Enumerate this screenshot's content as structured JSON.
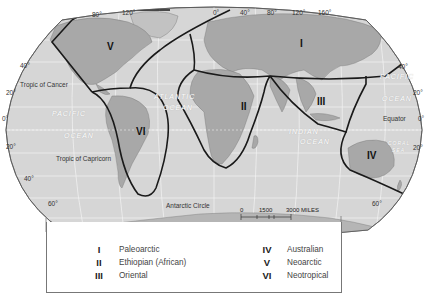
{
  "map": {
    "title": "Zoogeographic Realms",
    "projection_label": "ROBINSON PROJECTION",
    "longitude_labels": [
      "80°",
      "120°",
      "0°",
      "40°",
      "80°",
      "120°",
      "160°"
    ],
    "latitude_labels": {
      "left": [
        "40°",
        "20°",
        "0°",
        "20°",
        "40°",
        "60°"
      ],
      "right": [
        "40°",
        "20°",
        "0°",
        "20°",
        "60°"
      ]
    },
    "lines": {
      "tropic_of_cancer": "Tropic of Cancer",
      "tropic_of_capricorn": "Tropic of Capricorn",
      "equator": "Equator",
      "antarctic_circle": "Antarctic Circle"
    },
    "oceans": {
      "pacific_west_1": "PACIFIC",
      "pacific_west_2": "OCEAN",
      "atlantic_1": "ATLANTIC",
      "atlantic_2": "OCEAN",
      "indian_1": "INDIAN",
      "indian_2": "OCEAN",
      "pacific_east_1": "PACIFIC",
      "pacific_east_2": "OCEAN",
      "coral_1": "CORAL",
      "coral_2": "SEA"
    },
    "realm_markers": [
      "I",
      "II",
      "III",
      "IV",
      "V",
      "VI"
    ],
    "scale": {
      "miles_label": "0     1500     3000 MILES",
      "miles": [
        "0",
        "1500",
        "3000 MILES"
      ],
      "km": [
        "0",
        "1500",
        "3000 KILOMETRES"
      ]
    },
    "colors": {
      "ocean": "#d4d4d4",
      "land": "#a9a9a9",
      "boundary": "#1a1a1a",
      "grid": "#f2f2f2"
    }
  },
  "legend": {
    "items": [
      {
        "numeral": "I",
        "name": "Paleoarctic"
      },
      {
        "numeral": "II",
        "name": "Ethiopian  (African)"
      },
      {
        "numeral": "III",
        "name": "Oriental"
      },
      {
        "numeral": "IV",
        "name": "Australian"
      },
      {
        "numeral": "V",
        "name": "Neoarctic"
      },
      {
        "numeral": "VI",
        "name": "Neotropical"
      }
    ]
  }
}
